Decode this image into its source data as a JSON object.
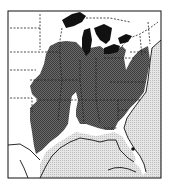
{
  "map": {
    "type": "species-range-map",
    "region": "Eastern United States",
    "colors": {
      "range": "#5a5a5a",
      "water_ocean": "#d8d8d8",
      "great_lakes": "#111111",
      "land": "#ffffff",
      "border": "#222222"
    },
    "legend": [],
    "markers": [
      {
        "label": "isolated-record",
        "location": "central Florida"
      }
    ]
  }
}
